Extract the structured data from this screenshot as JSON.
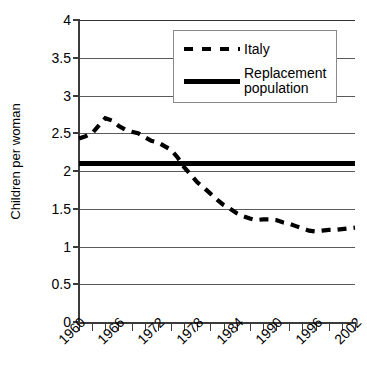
{
  "chart_data": {
    "type": "line",
    "title": "",
    "subtitle": "",
    "xlabel": "",
    "ylabel": "Children per woman",
    "ylim": [
      0,
      4
    ],
    "xlim": [
      1960,
      2002
    ],
    "grid": true,
    "legend_position": "top-right",
    "y_ticks": [
      "0",
      "0.5",
      "1",
      "1.5",
      "2",
      "2.5",
      "3",
      "3.5",
      "4"
    ],
    "y_tick_values": [
      0,
      0.5,
      1,
      1.5,
      2,
      2.5,
      3,
      3.5,
      4
    ],
    "x_tick_labels": [
      "1960",
      "1966",
      "1972",
      "1978",
      "1984",
      "1990",
      "1996",
      "2002"
    ],
    "x_tick_values": [
      1960,
      1966,
      1972,
      1978,
      1984,
      1990,
      1996,
      2002
    ],
    "x_minor_tick_values": [
      1960,
      1962,
      1964,
      1966,
      1968,
      1970,
      1972,
      1974,
      1976,
      1978,
      1980,
      1982,
      1984,
      1986,
      1988,
      1990,
      1992,
      1994,
      1996,
      1998,
      2000,
      2002
    ],
    "x": [
      1960,
      1961,
      1962,
      1963,
      1964,
      1965,
      1966,
      1967,
      1968,
      1969,
      1970,
      1971,
      1972,
      1973,
      1974,
      1975,
      1976,
      1977,
      1978,
      1979,
      1980,
      1981,
      1982,
      1983,
      1984,
      1985,
      1986,
      1987,
      1988,
      1989,
      1990,
      1991,
      1992,
      1993,
      1994,
      1995,
      1996,
      1997,
      1998,
      1999,
      2000,
      2001,
      2002
    ],
    "series": [
      {
        "name": "Italy",
        "style": "dashed",
        "color": "#000000",
        "values": [
          2.43,
          2.46,
          2.5,
          2.6,
          2.7,
          2.67,
          2.6,
          2.55,
          2.52,
          2.5,
          2.45,
          2.4,
          2.38,
          2.33,
          2.28,
          2.18,
          2.05,
          1.95,
          1.85,
          1.78,
          1.7,
          1.62,
          1.55,
          1.5,
          1.44,
          1.4,
          1.37,
          1.35,
          1.36,
          1.36,
          1.35,
          1.32,
          1.3,
          1.27,
          1.24,
          1.21,
          1.2,
          1.21,
          1.22,
          1.22,
          1.23,
          1.24,
          1.25
        ]
      },
      {
        "name": "Replacement population",
        "style": "solid",
        "color": "#000000",
        "constant_value": 2.1
      }
    ],
    "legend": [
      {
        "label": "Italy",
        "style": "dashed"
      },
      {
        "label": "Replacement\npopulation",
        "style": "solid"
      }
    ]
  },
  "legend": {
    "italy_label": "Italy",
    "replacement_line1": "Replacement",
    "replacement_line2": "population"
  },
  "axes": {
    "ylabel": "Children per woman"
  },
  "colors": {
    "series": "#000000",
    "grid": "#5a5a5a",
    "axis": "#3a3a3a",
    "background": "#ffffff"
  }
}
